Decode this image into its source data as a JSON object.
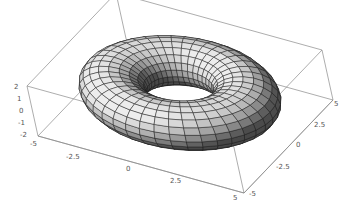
{
  "chart_data": {
    "type": "surface3d",
    "title": "",
    "surface": "torus",
    "major_radius": 3,
    "minor_radius": 1.5,
    "mesh": {
      "u_lines": 40,
      "v_lines": 20
    },
    "shading": "grayscale",
    "xlabel": "",
    "ylabel": "",
    "zlabel": "",
    "x_ticks": [
      "-5",
      "-2.5",
      "0",
      "2.5",
      "5"
    ],
    "y_ticks": [
      "-5",
      "-2.5",
      "0",
      "2.5",
      "5"
    ],
    "z_ticks": [
      "2",
      "1",
      "0",
      "-1",
      "-2"
    ],
    "xlim": [
      -5,
      5
    ],
    "ylim": [
      -5,
      5
    ],
    "zlim": [
      -2,
      2
    ],
    "box": true,
    "grid": false
  },
  "colors": {
    "box": "#8a8a8a",
    "mesh": "#1a1a1a",
    "tick_text": "#555555",
    "background": "#ffffff"
  },
  "layout": {
    "box_corners": {
      "back_top": [
        151,
        16
      ],
      "right_top": [
        343,
        51
      ],
      "left_top": [
        27,
        86
      ],
      "left_bottom": [
        38,
        136
      ],
      "right_bottom": [
        333,
        100
      ],
      "front_bottom": [
        244,
        193
      ]
    },
    "torus_center": [
      190,
      96
    ],
    "torus_hole": [
      178,
      82
    ]
  }
}
